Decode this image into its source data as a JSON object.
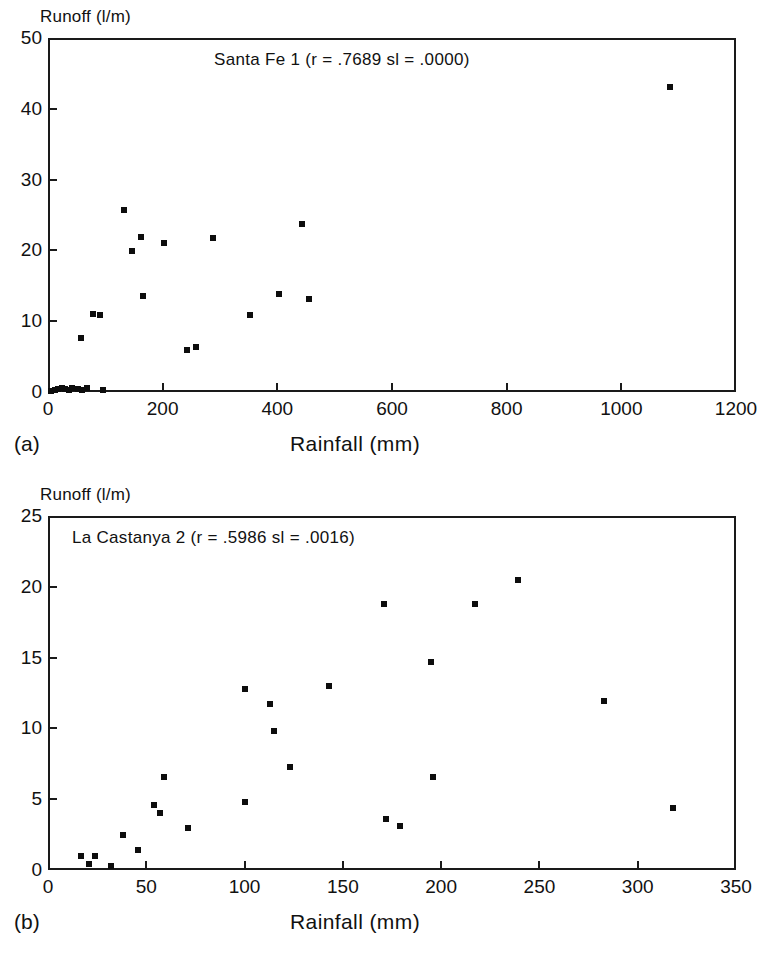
{
  "figure": {
    "background_color": "#ffffff",
    "ink_color": "#0d0d0d"
  },
  "panels": [
    {
      "tag": "(a)",
      "ylabel": "Runoff (l/m)",
      "xlabel": "Rainfall (mm)",
      "title": "Santa Fe 1 (r = .7689  sl = .0000)"
    },
    {
      "tag": "(b)",
      "ylabel": "Runoff (l/m)",
      "xlabel": "Rainfall (mm)",
      "title": "La Castanya 2 (r = .5986  sl = .0016)"
    }
  ],
  "chart_data": [
    {
      "type": "scatter",
      "title": "Santa Fe 1 (r = .7689  sl = .0000)",
      "site": "Santa Fe 1",
      "r": ".7689",
      "sl": ".0000",
      "xlabel": "Rainfall (mm)",
      "ylabel": "Runoff (l/m)",
      "xlim": [
        0,
        1200
      ],
      "ylim": [
        0,
        50
      ],
      "xticks": [
        0,
        200,
        400,
        600,
        800,
        1000,
        1200
      ],
      "yticks": [
        0,
        10,
        20,
        30,
        40,
        50
      ],
      "xticklabels": [
        "0",
        "200",
        "400",
        "600",
        "800",
        "1000",
        "1200"
      ],
      "yticklabels": [
        "0",
        "10",
        "20",
        "30",
        "40",
        "50"
      ],
      "grid": false,
      "legend": false,
      "marker": "square",
      "points": [
        {
          "x": 5,
          "y": 0.2
        },
        {
          "x": 12,
          "y": 0.3
        },
        {
          "x": 18,
          "y": 0.4
        },
        {
          "x": 24,
          "y": 0.5
        },
        {
          "x": 30,
          "y": 0.4
        },
        {
          "x": 36,
          "y": 0.3
        },
        {
          "x": 42,
          "y": 0.5
        },
        {
          "x": 52,
          "y": 0.4
        },
        {
          "x": 60,
          "y": 0.3
        },
        {
          "x": 68,
          "y": 0.6
        },
        {
          "x": 96,
          "y": 0.3
        },
        {
          "x": 58,
          "y": 7.6
        },
        {
          "x": 78,
          "y": 11.0
        },
        {
          "x": 90,
          "y": 10.9
        },
        {
          "x": 132,
          "y": 25.7
        },
        {
          "x": 146,
          "y": 19.9
        },
        {
          "x": 163,
          "y": 21.9
        },
        {
          "x": 166,
          "y": 13.5
        },
        {
          "x": 203,
          "y": 21.0
        },
        {
          "x": 243,
          "y": 6.0
        },
        {
          "x": 258,
          "y": 6.4
        },
        {
          "x": 288,
          "y": 21.8
        },
        {
          "x": 353,
          "y": 10.9
        },
        {
          "x": 403,
          "y": 13.9
        },
        {
          "x": 443,
          "y": 23.7
        },
        {
          "x": 455,
          "y": 13.1
        },
        {
          "x": 1085,
          "y": 43.1
        }
      ]
    },
    {
      "type": "scatter",
      "title": "La Castanya 2 (r = .5986  sl = .0016)",
      "site": "La Castanya 2",
      "r": ".5986",
      "sl": ".0016",
      "xlabel": "Rainfall (mm)",
      "ylabel": "Runoff (l/m)",
      "xlim": [
        0,
        350
      ],
      "ylim": [
        0,
        25
      ],
      "xticks": [
        0,
        50,
        100,
        150,
        200,
        250,
        300,
        350
      ],
      "yticks": [
        0,
        5,
        10,
        15,
        20,
        25
      ],
      "xticklabels": [
        "0",
        "50",
        "100",
        "150",
        "200",
        "250",
        "300",
        "350"
      ],
      "yticklabels": [
        "0",
        "5",
        "10",
        "15",
        "20",
        "25"
      ],
      "grid": false,
      "legend": false,
      "marker": "square",
      "points": [
        {
          "x": 17,
          "y": 1.0
        },
        {
          "x": 21,
          "y": 0.4
        },
        {
          "x": 24,
          "y": 1.0
        },
        {
          "x": 32,
          "y": 0.3
        },
        {
          "x": 38,
          "y": 2.5
        },
        {
          "x": 46,
          "y": 1.4
        },
        {
          "x": 54,
          "y": 4.6
        },
        {
          "x": 57,
          "y": 4.0
        },
        {
          "x": 59,
          "y": 6.6
        },
        {
          "x": 71,
          "y": 3.0
        },
        {
          "x": 100,
          "y": 12.8
        },
        {
          "x": 100,
          "y": 4.8
        },
        {
          "x": 113,
          "y": 11.7
        },
        {
          "x": 115,
          "y": 9.8
        },
        {
          "x": 123,
          "y": 7.3
        },
        {
          "x": 143,
          "y": 13.0
        },
        {
          "x": 171,
          "y": 18.8
        },
        {
          "x": 172,
          "y": 3.6
        },
        {
          "x": 179,
          "y": 3.1
        },
        {
          "x": 195,
          "y": 14.7
        },
        {
          "x": 196,
          "y": 6.6
        },
        {
          "x": 217,
          "y": 18.8
        },
        {
          "x": 239,
          "y": 20.5
        },
        {
          "x": 283,
          "y": 11.9
        },
        {
          "x": 318,
          "y": 4.4
        }
      ]
    }
  ]
}
